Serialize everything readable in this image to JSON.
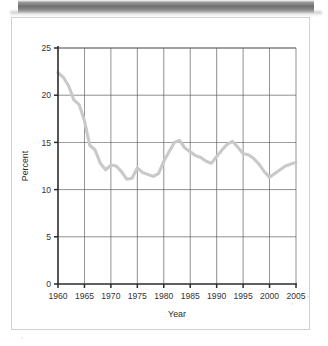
{
  "page": {
    "artifact_name": "scan-shadow-bar"
  },
  "chart_data": {
    "type": "line",
    "title": "",
    "xlabel": "Year",
    "ylabel": "Percent",
    "xlim": [
      1960,
      2005
    ],
    "ylim": [
      0,
      25
    ],
    "grid": true,
    "legend": "none",
    "line_color": "#c9c9c9",
    "axis_color": "#2b2b2b",
    "grid_color": "#5a5a5a",
    "xticks": [
      1960,
      1965,
      1970,
      1975,
      1980,
      1985,
      1990,
      1995,
      2000,
      2005
    ],
    "xtick_labels": [
      "1960",
      "1965",
      "1970",
      "1975",
      "1980",
      "1985",
      "1990",
      "1995",
      "2000",
      "2005"
    ],
    "yticks": [
      0,
      5,
      10,
      15,
      20,
      25
    ],
    "ytick_labels": [
      "0",
      "5",
      "10",
      "15",
      "20",
      "25"
    ],
    "series": [
      {
        "name": "Percent",
        "x": [
          1960,
          1961,
          1962,
          1963,
          1964,
          1965,
          1966,
          1967,
          1968,
          1969,
          1970,
          1971,
          1972,
          1973,
          1974,
          1975,
          1976,
          1977,
          1978,
          1979,
          1980,
          1981,
          1982,
          1983,
          1984,
          1985,
          1986,
          1987,
          1988,
          1989,
          1990,
          1991,
          1992,
          1993,
          1994,
          1995,
          1996,
          1997,
          1998,
          1999,
          2000,
          2001,
          2002,
          2003,
          2004,
          2005
        ],
        "values": [
          22.4,
          21.9,
          21.0,
          19.5,
          19.0,
          17.3,
          14.7,
          14.2,
          12.8,
          12.1,
          12.6,
          12.5,
          11.9,
          11.1,
          11.2,
          12.3,
          11.8,
          11.6,
          11.4,
          11.7,
          13.0,
          14.0,
          15.0,
          15.2,
          14.4,
          14.0,
          13.6,
          13.4,
          13.0,
          12.8,
          13.5,
          14.2,
          14.8,
          15.1,
          14.5,
          13.8,
          13.7,
          13.3,
          12.7,
          11.9,
          11.3,
          11.7,
          12.1,
          12.5,
          12.7,
          12.9
        ]
      }
    ]
  }
}
